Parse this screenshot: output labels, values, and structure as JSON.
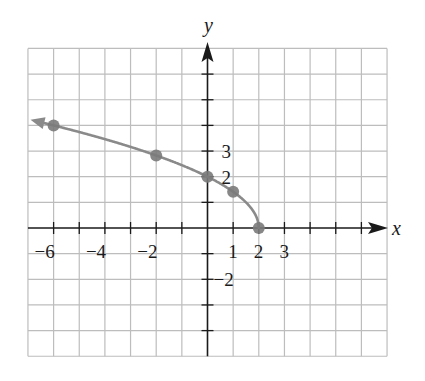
{
  "chart_data": {
    "type": "line",
    "title": "",
    "function": "f(x) = sqrt(4 - 2x)",
    "xlabel": "x",
    "ylabel": "y",
    "xlim": [
      -7,
      7
    ],
    "ylim": [
      -5,
      7
    ],
    "grid": true,
    "x_tick_labels": [
      {
        "value": -6,
        "text": "−6"
      },
      {
        "value": -4,
        "text": "−4"
      },
      {
        "value": -2,
        "text": "−2"
      },
      {
        "value": 1,
        "text": "1"
      },
      {
        "value": 2,
        "text": "2"
      },
      {
        "value": 3,
        "text": "3"
      }
    ],
    "y_tick_labels": [
      {
        "value": 3,
        "text": "3"
      },
      {
        "value": 2,
        "text": "2"
      },
      {
        "value": -2,
        "text": "−2"
      }
    ],
    "points": [
      {
        "x": -6,
        "y": 4
      },
      {
        "x": -2,
        "y": 2.83
      },
      {
        "x": 0,
        "y": 2
      },
      {
        "x": 1,
        "y": 1.41
      },
      {
        "x": 2,
        "y": 0
      }
    ],
    "curve_arrow": "left",
    "colors": {
      "curve": "#8a8a8a",
      "point": "#7a7a7a",
      "grid": "#bdbdbd",
      "axis": "#1a1a1a"
    }
  }
}
